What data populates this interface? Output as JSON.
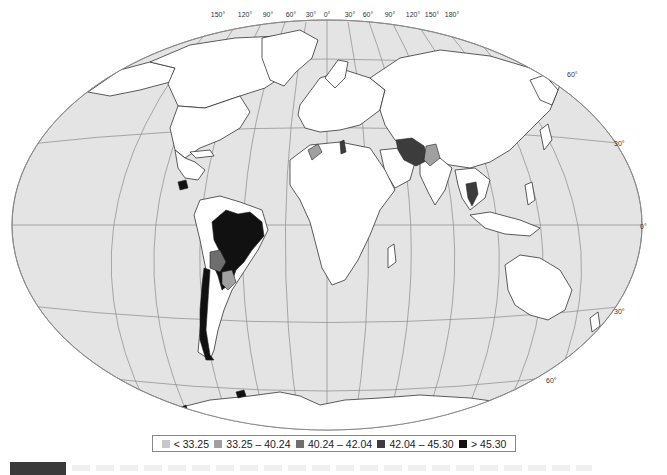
{
  "map": {
    "projection": "Winkel tripel / elliptical world map",
    "ocean_color": "#e4e4e4",
    "land_default_color": "#ffffff",
    "border_color": "#333333",
    "graticule_color": "#8a8a8a",
    "longitude_labels": [
      "150°",
      "120°",
      "90°",
      "60°",
      "30°",
      "0°",
      "30°",
      "60°",
      "90°",
      "120°",
      "150°",
      "180°"
    ],
    "latitude_labels": {
      "n60": "60°",
      "n30": "30°",
      "eq": "0°",
      "s30": "30°",
      "s60": "60°"
    }
  },
  "legend": {
    "items": [
      {
        "label": "< 33.25",
        "color": "#c8c8c8"
      },
      {
        "label": "33.25 – 40.24",
        "color": "#a0a0a0"
      },
      {
        "label": "40.24 – 42.04",
        "color": "#6e6e6e"
      },
      {
        "label": "42.04 – 45.30",
        "color": "#3c3c3c"
      },
      {
        "label": "> 45.30",
        "color": "#111111"
      }
    ]
  },
  "highlighted_regions": [
    {
      "name": "Brazil",
      "class": "> 45.30"
    },
    {
      "name": "Chile",
      "class": "> 45.30"
    },
    {
      "name": "Honduras/Guatemala",
      "class": "> 45.30"
    },
    {
      "name": "Paraguay",
      "class": "> 45.30"
    },
    {
      "name": "Bolivia",
      "class": "40.24 – 42.04"
    },
    {
      "name": "Iran",
      "class": "42.04 – 45.30"
    },
    {
      "name": "Thailand",
      "class": "42.04 – 45.30"
    },
    {
      "name": "Pakistan",
      "class": "33.25 – 40.24"
    },
    {
      "name": "Morocco",
      "class": "33.25 – 40.24"
    },
    {
      "name": "Tunisia",
      "class": "42.04 – 45.30"
    },
    {
      "name": "Argentina north strip",
      "class": "33.25 – 40.24"
    }
  ]
}
